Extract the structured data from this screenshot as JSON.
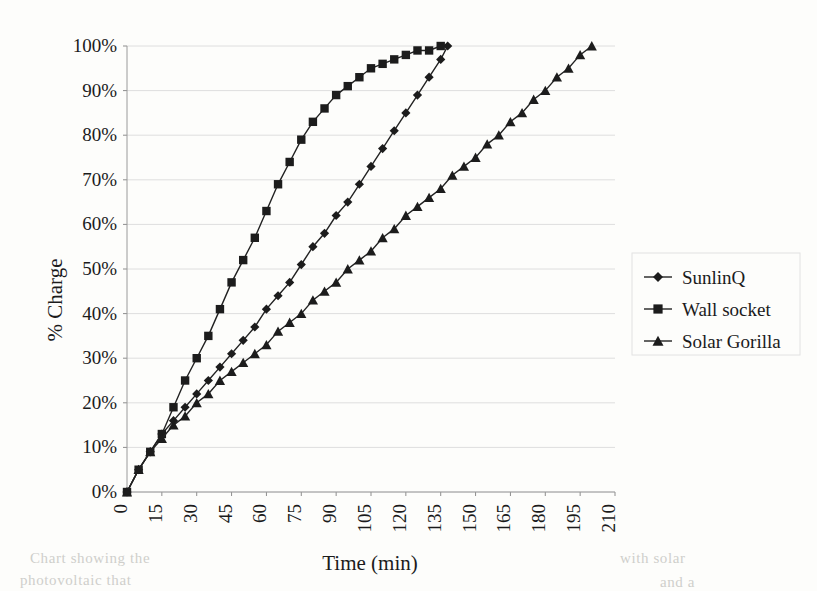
{
  "chart_data": {
    "type": "line",
    "title": "",
    "xlabel": "Time (min)",
    "ylabel": "% Charge",
    "xlim": [
      0,
      210
    ],
    "ylim": [
      0,
      100
    ],
    "grid": true,
    "legend_position": "right",
    "x_tick_labels": [
      "0",
      "15",
      "30",
      "45",
      "60",
      "75",
      "90",
      "105",
      "120",
      "135",
      "150",
      "165",
      "180",
      "195",
      "210"
    ],
    "x_ticks": [
      0,
      15,
      30,
      45,
      60,
      75,
      90,
      105,
      120,
      135,
      150,
      165,
      180,
      195,
      210
    ],
    "y_tick_labels": [
      "0%",
      "10%",
      "20%",
      "30%",
      "40%",
      "50%",
      "60%",
      "70%",
      "80%",
      "90%",
      "100%"
    ],
    "y_ticks": [
      0,
      10,
      20,
      30,
      40,
      50,
      60,
      70,
      80,
      90,
      100
    ],
    "series": [
      {
        "name": "SunlinQ",
        "marker": "diamond",
        "x": [
          0,
          5,
          10,
          15,
          20,
          25,
          30,
          35,
          40,
          45,
          50,
          55,
          60,
          65,
          70,
          75,
          80,
          85,
          90,
          95,
          100,
          105,
          110,
          115,
          120,
          125,
          130,
          135,
          138
        ],
        "values": [
          0,
          5,
          9,
          13,
          16,
          19,
          22,
          25,
          28,
          31,
          34,
          37,
          41,
          44,
          47,
          51,
          55,
          58,
          62,
          65,
          69,
          73,
          77,
          81,
          85,
          89,
          93,
          97,
          100
        ]
      },
      {
        "name": "Wall socket",
        "marker": "square",
        "x": [
          0,
          5,
          10,
          15,
          20,
          25,
          30,
          35,
          40,
          45,
          50,
          55,
          60,
          65,
          70,
          75,
          80,
          85,
          90,
          95,
          100,
          105,
          110,
          115,
          120,
          125,
          130,
          135
        ],
        "values": [
          0,
          5,
          9,
          13,
          19,
          25,
          30,
          35,
          41,
          47,
          52,
          57,
          63,
          69,
          74,
          79,
          83,
          86,
          89,
          91,
          93,
          95,
          96,
          97,
          98,
          99,
          99,
          100
        ]
      },
      {
        "name": "Solar Gorilla",
        "marker": "triangle",
        "x": [
          0,
          5,
          10,
          15,
          20,
          25,
          30,
          35,
          40,
          45,
          50,
          55,
          60,
          65,
          70,
          75,
          80,
          85,
          90,
          95,
          100,
          105,
          110,
          115,
          120,
          125,
          130,
          135,
          140,
          145,
          150,
          155,
          160,
          165,
          170,
          175,
          180,
          185,
          190,
          195,
          200
        ],
        "values": [
          0,
          5,
          9,
          12,
          15,
          17,
          20,
          22,
          25,
          27,
          29,
          31,
          33,
          36,
          38,
          40,
          43,
          45,
          47,
          50,
          52,
          54,
          57,
          59,
          62,
          64,
          66,
          68,
          71,
          73,
          75,
          78,
          80,
          83,
          85,
          88,
          90,
          93,
          95,
          98,
          100
        ]
      }
    ]
  },
  "ghost_text": {
    "line1": "Chart showing the",
    "line2": "photovoltaic that",
    "line3": "with solar",
    "line4": "and a"
  }
}
